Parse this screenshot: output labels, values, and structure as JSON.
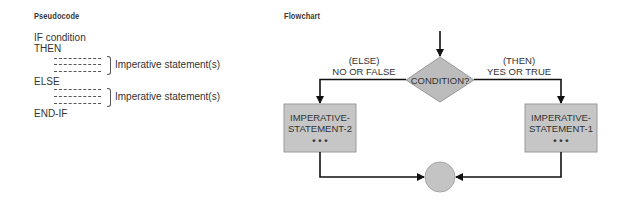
{
  "pseudocode": {
    "heading": "Pseudocode",
    "lines": {
      "if": "IF condition",
      "then": "THEN",
      "else": "ELSE",
      "endif": "END-IF"
    },
    "then_block_label": "Imperative statement(s)",
    "else_block_label": "Imperative statement(s)"
  },
  "flowchart": {
    "heading": "Flowchart",
    "decision": "CONDITION?",
    "else_branch": {
      "line1": "(ELSE)",
      "line2": "NO OR FALSE"
    },
    "then_branch": {
      "line1": "(THEN)",
      "line2": "YES OR TRUE"
    },
    "box_left": {
      "line1": "IMPERATIVE-",
      "line2": "STATEMENT-2",
      "ellipsis": "• • •"
    },
    "box_right": {
      "line1": "IMPERATIVE-",
      "line2": "STATEMENT-1",
      "ellipsis": "• • •"
    }
  },
  "colors": {
    "shape_fill": "#c6c6c6",
    "diamond_fill": "#bcbcbc",
    "shape_border": "#9a9a9a",
    "line": "#111111"
  }
}
